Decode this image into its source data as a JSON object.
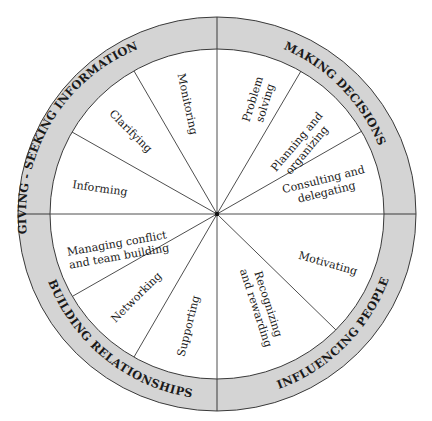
{
  "diagram": {
    "type": "leadership-behavior-wheel",
    "center": [
      217,
      214
    ],
    "colors": {
      "ring_fill": "#d4d4d4",
      "line": "#3a3a3a",
      "text": "#1a1a1a",
      "background": "#ffffff"
    },
    "categories": [
      {
        "id": "giving-seeking-information",
        "label": "GIVING - SEEKING INFORMATION"
      },
      {
        "id": "making-decisions",
        "label": "MAKING DECISIONS"
      },
      {
        "id": "influencing-people",
        "label": "INFLUENCING PEOPLE"
      },
      {
        "id": "building-relationships",
        "label": "BUILDING RELATIONSHIPS"
      }
    ],
    "segments": [
      {
        "category": "making-decisions",
        "lines": [
          "Problem",
          "solving"
        ]
      },
      {
        "category": "making-decisions",
        "lines": [
          "Planning and",
          "organizing"
        ]
      },
      {
        "category": "making-decisions",
        "lines": [
          "Consulting and",
          "delegating"
        ]
      },
      {
        "category": "influencing-people",
        "lines": [
          "Motivating"
        ]
      },
      {
        "category": "influencing-people",
        "lines": [
          "Recognizing",
          "and rewarding"
        ]
      },
      {
        "category": "building-relationships",
        "lines": [
          "Supporting"
        ]
      },
      {
        "category": "building-relationships",
        "lines": [
          "Networking"
        ]
      },
      {
        "category": "building-relationships",
        "lines": [
          "Managing conflict",
          "and team building"
        ]
      },
      {
        "category": "giving-seeking-information",
        "lines": [
          "Informing"
        ]
      },
      {
        "category": "giving-seeking-information",
        "lines": [
          "Clarifying"
        ]
      },
      {
        "category": "giving-seeking-information",
        "lines": [
          "Monitoring"
        ]
      }
    ]
  }
}
